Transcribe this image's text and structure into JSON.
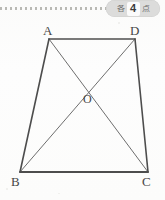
{
  "page": {
    "background_color": "#fdfdfc",
    "width": 165,
    "height": 200
  },
  "cut_line": {
    "style": "dashed",
    "color": "#b9b9b4"
  },
  "score_badge": {
    "prefix_char": "各",
    "points": "4",
    "suffix_char": "点",
    "full_text": "各4点",
    "background_color": "#dcdcdb",
    "number_box_color": "#fbfbfb",
    "text_color": "#6f6f6e"
  },
  "figure": {
    "type": "trapezoid-with-diagonals",
    "stroke_color": "#4a4a4a",
    "diagonal_stroke_color": "#6b6b6b",
    "vertices": [
      {
        "name": "A",
        "x": 49,
        "y": 39,
        "label": "A",
        "label_position": "above-left"
      },
      {
        "name": "D",
        "x": 135,
        "y": 39,
        "label": "D",
        "label_position": "above-right"
      },
      {
        "name": "B",
        "x": 20,
        "y": 172,
        "label": "B",
        "label_position": "below-left"
      },
      {
        "name": "C",
        "x": 148,
        "y": 172,
        "label": "C",
        "label_position": "below-right"
      }
    ],
    "intersection": {
      "name": "O",
      "x": 88,
      "y": 88,
      "label": "O",
      "label_position": "below"
    },
    "edges": [
      {
        "from": "A",
        "to": "D",
        "kind": "side"
      },
      {
        "from": "D",
        "to": "C",
        "kind": "side"
      },
      {
        "from": "C",
        "to": "B",
        "kind": "side"
      },
      {
        "from": "B",
        "to": "A",
        "kind": "side"
      },
      {
        "from": "A",
        "to": "C",
        "kind": "diagonal"
      },
      {
        "from": "B",
        "to": "D",
        "kind": "diagonal"
      }
    ]
  }
}
